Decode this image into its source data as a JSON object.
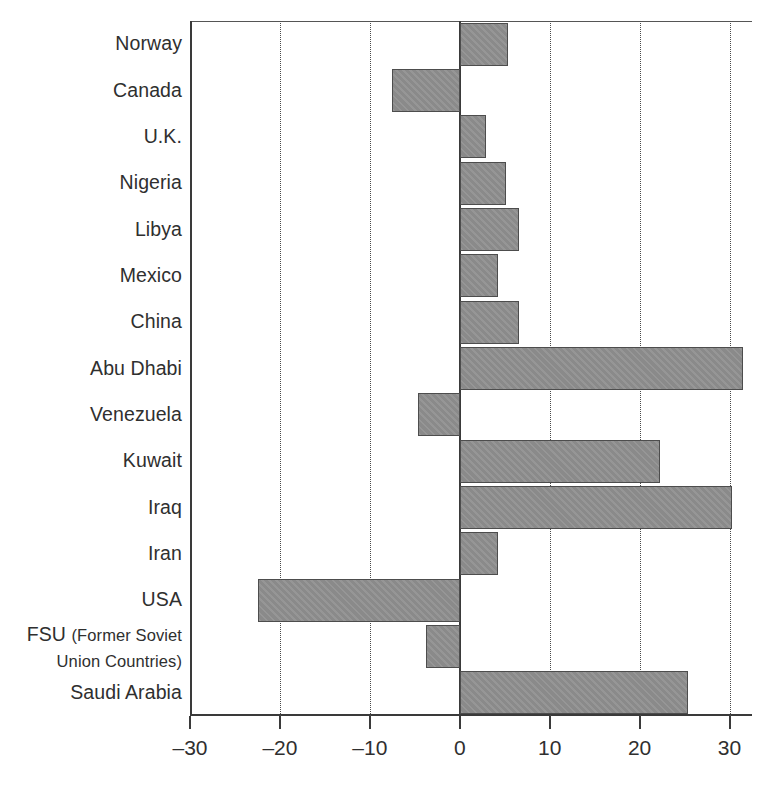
{
  "chart_data": {
    "type": "bar",
    "orientation": "horizontal",
    "title": "",
    "subtitle": "",
    "xlabel": "",
    "ylabel": "",
    "xlim": [
      -30,
      32.5
    ],
    "ylim": [],
    "grid": "vertical-dotted",
    "legend": "none",
    "xticks": [
      -30,
      -20,
      -10,
      0,
      10,
      20,
      30
    ],
    "xtick_labels": [
      "–30",
      "–20",
      "–10",
      "0",
      "10",
      "20",
      "30"
    ],
    "categories": [
      "Norway",
      "Canada",
      "U.K.",
      "Nigeria",
      "Libya",
      "Mexico",
      "China",
      "Abu Dhabi",
      "Venezuela",
      "Kuwait",
      "Iraq",
      "Iran",
      "USA",
      "FSU (Former Soviet Union Countries)",
      "Saudi Arabia"
    ],
    "category_labels": [
      {
        "line1": "Norway",
        "line2": ""
      },
      {
        "line1": "Canada",
        "line2": ""
      },
      {
        "line1": "U.K.",
        "line2": ""
      },
      {
        "line1": "Nigeria",
        "line2": ""
      },
      {
        "line1": "Libya",
        "line2": ""
      },
      {
        "line1": "Mexico",
        "line2": ""
      },
      {
        "line1": "China",
        "line2": ""
      },
      {
        "line1": "Abu Dhabi",
        "line2": ""
      },
      {
        "line1": "Venezuela",
        "line2": ""
      },
      {
        "line1": "Kuwait",
        "line2": ""
      },
      {
        "line1": "Iraq",
        "line2": ""
      },
      {
        "line1": "Iran",
        "line2": ""
      },
      {
        "line1": "USA",
        "line2": ""
      },
      {
        "line1": "FSU (Former Soviet",
        "line2": "Union Countries)"
      },
      {
        "line1": "Saudi Arabia",
        "line2": ""
      }
    ],
    "values": [
      5.4,
      -7.5,
      2.9,
      5.1,
      6.6,
      4.2,
      6.6,
      31.5,
      -4.6,
      22.3,
      30.3,
      4.3,
      -22.4,
      -3.7,
      25.4
    ],
    "bar_color": "#8a8a8a",
    "bar_edge_color": "#4d4d4d",
    "axis_color": "#3a3a3a",
    "grid_color": "#4a4a4a",
    "text_color": "#2f2f2f"
  }
}
